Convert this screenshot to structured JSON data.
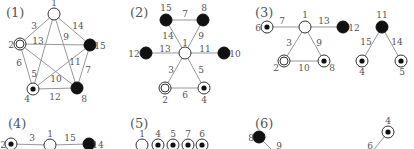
{
  "colors": {
    "edge": "#999999",
    "node_stroke": "#333333",
    "black": "#111111",
    "white": "#ffffff",
    "text": "#555555"
  },
  "panels": [
    {
      "label": "(1)",
      "label_pos": [
        6,
        17
      ],
      "nodes": [
        {
          "id": "1",
          "type": "white",
          "x": 54,
          "y": 14,
          "lx": 54,
          "ly": 6,
          "anchor": "middle"
        },
        {
          "id": "2",
          "type": "double",
          "x": 20,
          "y": 44,
          "lx": 11,
          "ly": 48,
          "anchor": "middle"
        },
        {
          "id": "15",
          "type": "black",
          "x": 90,
          "y": 45,
          "lx": 100,
          "ly": 49,
          "anchor": "middle"
        },
        {
          "id": "4",
          "type": "target",
          "x": 33,
          "y": 89,
          "lx": 27,
          "ly": 102,
          "anchor": "middle"
        },
        {
          "id": "8",
          "type": "black",
          "x": 77,
          "y": 88,
          "lx": 84,
          "ly": 102,
          "anchor": "middle"
        }
      ],
      "edges": [
        {
          "a": "1",
          "b": "2",
          "w": "3",
          "lx": 34,
          "ly": 29
        },
        {
          "a": "1",
          "b": "15",
          "w": "14",
          "lx": 78,
          "ly": 29
        },
        {
          "a": "1",
          "b": "4",
          "w": "5",
          "lx": 34,
          "ly": 77
        },
        {
          "a": "1",
          "b": "8",
          "w": "9",
          "lx": 66,
          "ly": 40
        },
        {
          "a": "2",
          "b": "15",
          "w": "13",
          "lx": 38,
          "ly": 44
        },
        {
          "a": "2",
          "b": "4",
          "w": "6",
          "lx": 19,
          "ly": 66
        },
        {
          "a": "2",
          "b": "8",
          "w": "10",
          "lx": 56,
          "ly": 82
        },
        {
          "a": "15",
          "b": "4",
          "w": "11",
          "lx": 75,
          "ly": 65
        },
        {
          "a": "15",
          "b": "8",
          "w": "7",
          "lx": 88,
          "ly": 73
        },
        {
          "a": "4",
          "b": "8",
          "w": "12",
          "lx": 55,
          "ly": 100
        }
      ]
    },
    {
      "label": "(2)",
      "label_pos": [
        130,
        17
      ],
      "nodes": [
        {
          "id": "15",
          "type": "black",
          "x": 166,
          "y": 20,
          "lx": 166,
          "ly": 11,
          "anchor": "middle"
        },
        {
          "id": "8",
          "type": "black",
          "x": 203,
          "y": 20,
          "lx": 204,
          "ly": 11,
          "anchor": "middle"
        },
        {
          "id": "1",
          "type": "white",
          "x": 185,
          "y": 53,
          "lx": 185,
          "ly": 46,
          "anchor": "middle"
        },
        {
          "id": "12",
          "type": "black",
          "x": 146,
          "y": 53,
          "lx": 134,
          "ly": 57,
          "anchor": "middle"
        },
        {
          "id": "10",
          "type": "black",
          "x": 224,
          "y": 53,
          "lx": 235,
          "ly": 57,
          "anchor": "middle"
        },
        {
          "id": "2",
          "type": "double",
          "x": 165,
          "y": 88,
          "lx": 165,
          "ly": 103,
          "anchor": "middle"
        },
        {
          "id": "4",
          "type": "target",
          "x": 204,
          "y": 88,
          "lx": 204,
          "ly": 103,
          "anchor": "middle"
        }
      ],
      "edges": [
        {
          "a": "15",
          "b": "8",
          "w": "7",
          "lx": 185,
          "ly": 17
        },
        {
          "a": "15",
          "b": "1",
          "w": "14",
          "lx": 168,
          "ly": 39
        },
        {
          "a": "8",
          "b": "1",
          "w": "9",
          "lx": 201,
          "ly": 39
        },
        {
          "a": "12",
          "b": "1",
          "w": "13",
          "lx": 165,
          "ly": 52
        },
        {
          "a": "1",
          "b": "10",
          "w": "11",
          "lx": 205,
          "ly": 52
        },
        {
          "a": "1",
          "b": "2",
          "w": "3",
          "lx": 171,
          "ly": 73
        },
        {
          "a": "1",
          "b": "4",
          "w": "5",
          "lx": 201,
          "ly": 73
        },
        {
          "a": "2",
          "b": "4",
          "w": "6",
          "lx": 185,
          "ly": 98
        }
      ]
    },
    {
      "label": "(3)",
      "label_pos": [
        255,
        17
      ],
      "nodes": [
        {
          "id": "6",
          "type": "target",
          "x": 267,
          "y": 27,
          "lx": 258,
          "ly": 31,
          "anchor": "middle"
        },
        {
          "id": "1",
          "type": "white",
          "x": 305,
          "y": 27,
          "lx": 305,
          "ly": 18,
          "anchor": "middle"
        },
        {
          "id": "12",
          "type": "black",
          "x": 343,
          "y": 27,
          "lx": 354,
          "ly": 31,
          "anchor": "middle"
        },
        {
          "id": "2",
          "type": "double",
          "x": 284,
          "y": 61,
          "lx": 276,
          "ly": 71,
          "anchor": "middle"
        },
        {
          "id": "8",
          "type": "target",
          "x": 324,
          "y": 61,
          "lx": 332,
          "ly": 71,
          "anchor": "middle"
        },
        {
          "id": "11",
          "type": "black",
          "x": 382,
          "y": 27,
          "lx": 382,
          "ly": 18,
          "anchor": "middle"
        },
        {
          "id": "4",
          "type": "target",
          "x": 362,
          "y": 61,
          "lx": 362,
          "ly": 75,
          "anchor": "middle"
        },
        {
          "id": "5",
          "type": "target",
          "x": 401,
          "y": 61,
          "lx": 402,
          "ly": 75,
          "anchor": "middle"
        }
      ],
      "edges": [
        {
          "a": "6",
          "b": "1",
          "w": "7",
          "lx": 282,
          "ly": 24
        },
        {
          "a": "1",
          "b": "12",
          "w": "13",
          "lx": 324,
          "ly": 24
        },
        {
          "a": "1",
          "b": "2",
          "w": "3",
          "lx": 289,
          "ly": 46
        },
        {
          "a": "1",
          "b": "8",
          "w": "9",
          "lx": 319,
          "ly": 46
        },
        {
          "a": "2",
          "b": "8",
          "w": "10",
          "lx": 304,
          "ly": 71
        },
        {
          "a": "11",
          "b": "4",
          "w": "15",
          "lx": 366,
          "ly": 45
        },
        {
          "a": "11",
          "b": "5",
          "w": "14",
          "lx": 397,
          "ly": 45
        }
      ]
    },
    {
      "label": "(4)",
      "label_pos": [
        8,
        128
      ],
      "nodes": [
        {
          "id": "2",
          "type": "target",
          "x": 11,
          "y": 144,
          "lx": 3,
          "ly": 148,
          "anchor": "middle"
        },
        {
          "id": "1",
          "type": "white",
          "x": 50,
          "y": 145,
          "lx": 50,
          "ly": 137,
          "anchor": "middle"
        },
        {
          "id": "14",
          "type": "black",
          "x": 89,
          "y": 144,
          "lx": 98,
          "ly": 148,
          "anchor": "middle"
        }
      ],
      "edges": [
        {
          "a": "2",
          "b": "1",
          "w": "3",
          "lx": 32,
          "ly": 141
        },
        {
          "a": "1",
          "b": "14",
          "w": "15",
          "lx": 70,
          "ly": 141
        }
      ]
    },
    {
      "label": "(5)",
      "label_pos": [
        130,
        128
      ],
      "nodes": [
        {
          "id": "1",
          "type": "white",
          "x": 142,
          "y": 145,
          "lx": 142,
          "ly": 137,
          "anchor": "middle"
        },
        {
          "id": "4",
          "type": "target",
          "x": 158,
          "y": 145,
          "lx": 158,
          "ly": 137,
          "anchor": "middle"
        },
        {
          "id": "5",
          "type": "target",
          "x": 173,
          "y": 145,
          "lx": 173,
          "ly": 137,
          "anchor": "middle"
        },
        {
          "id": "7",
          "type": "target",
          "x": 188,
          "y": 145,
          "lx": 188,
          "ly": 137,
          "anchor": "middle"
        },
        {
          "id": "6",
          "type": "target",
          "x": 202,
          "y": 145,
          "lx": 202,
          "ly": 137,
          "anchor": "middle"
        }
      ],
      "edges": []
    },
    {
      "label": "(6)",
      "label_pos": [
        255,
        128
      ],
      "nodes": [
        {
          "id": "8",
          "type": "black",
          "x": 259,
          "y": 137,
          "lx": 251,
          "ly": 141,
          "anchor": "middle"
        },
        {
          "id": "4",
          "type": "target",
          "x": 388,
          "y": 132,
          "lx": 388,
          "ly": 124,
          "anchor": "middle"
        }
      ],
      "edges": [
        {
          "a": "8",
          "b": "_a",
          "w": "9",
          "lx": 279,
          "ly": 149,
          "tx": 274,
          "ty": 152
        },
        {
          "a": "4",
          "b": "_b",
          "w": "6",
          "lx": 370,
          "ly": 149,
          "tx": 372,
          "ty": 152
        }
      ]
    }
  ]
}
